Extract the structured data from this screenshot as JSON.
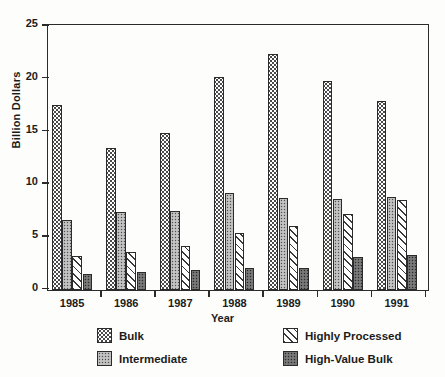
{
  "chart_data": {
    "type": "bar",
    "title": "",
    "xlabel": "Year",
    "ylabel": "Billion Dollars",
    "categories": [
      "1985",
      "1986",
      "1987",
      "1988",
      "1989",
      "1990",
      "1991"
    ],
    "ylim": [
      0,
      25
    ],
    "yticks": [
      0,
      5,
      10,
      15,
      20,
      25
    ],
    "ytick_labels": [
      "0",
      "5",
      "10",
      "15",
      "20",
      "25"
    ],
    "grid": false,
    "legend_position": "below-plot",
    "series": [
      {
        "name": "Bulk",
        "pattern": "sparse-dots-white",
        "values": [
          17.5,
          13.5,
          14.9,
          20.2,
          22.4,
          19.8,
          17.9
        ]
      },
      {
        "name": "Intermediate",
        "pattern": "dense-dots-grey",
        "values": [
          6.6,
          7.4,
          7.5,
          9.2,
          8.7,
          8.6,
          8.8
        ]
      },
      {
        "name": "Highly Processed",
        "pattern": "diagonal-hatch-white",
        "values": [
          3.2,
          3.6,
          4.2,
          5.4,
          6.1,
          7.2,
          8.5
        ]
      },
      {
        "name": "High-Value Bulk",
        "pattern": "dark-dots",
        "values": [
          1.5,
          1.7,
          1.9,
          2.1,
          2.1,
          3.1,
          3.3
        ]
      }
    ]
  },
  "colors": {
    "axis": "#2b2b2b",
    "text": "#1c1c1c",
    "background": "#fdfdfb",
    "bulk": "#ffffff",
    "intermediate": "#b6b6b6",
    "highly_processed": "#ffffff",
    "high_value_bulk": "#6e6e6e"
  }
}
